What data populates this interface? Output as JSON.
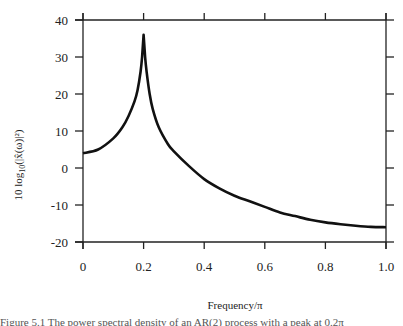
{
  "chart_data": {
    "type": "line",
    "title": "",
    "xlabel": "Frequency/π",
    "ylabel": "10 log10(|x̂(ω)|²)",
    "xlim": [
      0,
      1.0
    ],
    "ylim": [
      -20,
      40
    ],
    "grid": false,
    "legend": null,
    "x_ticks": [
      "0",
      "0.2",
      "0.4",
      "0.6",
      "0.8",
      "1.0"
    ],
    "y_ticks": [
      "40",
      "30",
      "20",
      "10",
      "0",
      "-10",
      "-20"
    ],
    "series": [
      {
        "name": "power spectrum",
        "color": "#111111",
        "x": [
          0,
          0.05,
          0.1,
          0.13,
          0.15,
          0.17,
          0.18,
          0.19,
          0.195,
          0.2,
          0.205,
          0.21,
          0.22,
          0.23,
          0.25,
          0.28,
          0.3,
          0.35,
          0.4,
          0.45,
          0.5,
          0.55,
          0.6,
          0.65,
          0.7,
          0.75,
          0.8,
          0.85,
          0.9,
          0.95,
          1.0
        ],
        "values": [
          4,
          5,
          8,
          11,
          14,
          18,
          21,
          26,
          30,
          36,
          30,
          26,
          20,
          16,
          11,
          6.5,
          4.5,
          0.5,
          -3,
          -5.5,
          -7.5,
          -9,
          -10.5,
          -12,
          -13,
          -14,
          -14.7,
          -15.2,
          -15.6,
          -15.9,
          -16
        ]
      }
    ]
  },
  "axes": {
    "y_label_text": "10 log",
    "y_label_sub": "10",
    "y_label_tail": "(|x̂(ω)|²)",
    "x_label_text": "Frequency/π"
  },
  "caption": {
    "text": "Figure 5.1   The power spectral density of an AR(2) process with a peak at 0.2π"
  }
}
